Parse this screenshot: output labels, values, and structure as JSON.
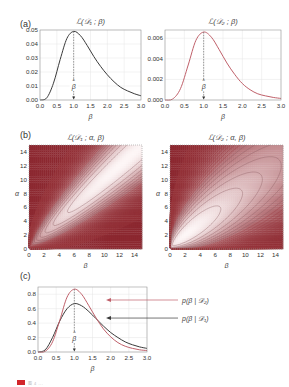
{
  "figure": {
    "panels": {
      "a": {
        "label": "(a)"
      },
      "b": {
        "label": "(b)"
      },
      "c": {
        "label": "(c)"
      }
    },
    "caption": "图 4 ..."
  },
  "colors": {
    "dark_curve": "#3a3a3a",
    "red_curve": "#c0606a",
    "contour_dark": "#8a2a30",
    "contour_light": "#fbeeee",
    "grid": "#e4e4e4",
    "frame": "#999999",
    "caption_mark": "#d2262a"
  },
  "chart_data": [
    {
      "id": "a-left",
      "type": "line",
      "title": "ℒ(𝒟₁ ; β)",
      "xlabel": "β",
      "ylabel": "",
      "xlim": [
        0,
        3.0
      ],
      "ylim": [
        0,
        0.05
      ],
      "xticks": [
        "0.0",
        "0.5",
        "1.0",
        "1.5",
        "2.0",
        "2.5",
        "3.0"
      ],
      "yticks": [
        "0.00",
        "0.01",
        "0.02",
        "0.03",
        "0.04",
        "0.05"
      ],
      "grid": true,
      "annotation": {
        "text": "β̂",
        "x": 1.0,
        "style": "dashed vertical arrow to peak"
      },
      "series": [
        {
          "name": "L(D1;β)",
          "color": "#3a3a3a",
          "x": [
            0.0,
            0.2,
            0.4,
            0.6,
            0.8,
            1.0,
            1.2,
            1.4,
            1.6,
            1.8,
            2.0,
            2.2,
            2.4,
            2.6,
            2.8,
            3.0
          ],
          "y": [
            0.0,
            0.0015,
            0.012,
            0.029,
            0.044,
            0.049,
            0.046,
            0.039,
            0.031,
            0.024,
            0.018,
            0.013,
            0.009,
            0.0065,
            0.0045,
            0.003
          ]
        }
      ]
    },
    {
      "id": "a-right",
      "type": "line",
      "title": "ℒ(𝒟₂ ; β)",
      "xlabel": "β",
      "ylabel": "",
      "xlim": [
        0,
        3.0
      ],
      "ylim": [
        0,
        0.0068
      ],
      "xticks": [
        "0.0",
        "0.5",
        "1.0",
        "1.5",
        "2.0",
        "2.5",
        "3.0"
      ],
      "yticks": [
        "0.000",
        "0.002",
        "0.004",
        "0.006"
      ],
      "grid": true,
      "annotation": {
        "text": "β̂",
        "x": 1.0,
        "style": "dashed vertical arrow to peak"
      },
      "series": [
        {
          "name": "L(D2;β)",
          "color": "#c0606a",
          "x": [
            0.0,
            0.2,
            0.4,
            0.6,
            0.8,
            1.0,
            1.2,
            1.4,
            1.6,
            1.8,
            2.0,
            2.2,
            2.4,
            2.6,
            2.8,
            3.0
          ],
          "y": [
            0.0,
            0.0001,
            0.0011,
            0.0034,
            0.0058,
            0.0066,
            0.0061,
            0.0049,
            0.0036,
            0.0025,
            0.0016,
            0.001,
            0.0006,
            0.0004,
            0.00025,
            0.00015
          ]
        }
      ]
    },
    {
      "id": "b-left",
      "type": "heatmap",
      "title": "ℒ(𝒟₁ ; α, β)",
      "xlabel": "β",
      "ylabel": "α",
      "xlim": [
        0,
        15
      ],
      "ylim": [
        0,
        15
      ],
      "xticks": [
        "0",
        "2",
        "4",
        "6",
        "8",
        "10",
        "12",
        "14"
      ],
      "yticks": [
        "0",
        "2",
        "4",
        "6",
        "8",
        "10",
        "12",
        "14"
      ],
      "style": "contour plot, white ridge along α≈β diagonal, dark red toward edges",
      "ridge": "narrow elongated ellipses along line α ≈ 0.9β"
    },
    {
      "id": "b-right",
      "type": "heatmap",
      "title": "ℒ(𝒟₂ ; α, β)",
      "xlabel": "β",
      "ylabel": "α",
      "xlim": [
        0,
        15
      ],
      "ylim": [
        0,
        15
      ],
      "xticks": [
        "0",
        "2",
        "4",
        "6",
        "8",
        "10",
        "12",
        "14"
      ],
      "yticks": [
        "0",
        "2",
        "4",
        "6",
        "8",
        "10",
        "12",
        "14"
      ],
      "style": "contour plot, broad nested ellipses centered near (β≈3, α≈3)",
      "ridge": "wider contours than D1"
    },
    {
      "id": "c",
      "type": "line",
      "title": "",
      "xlabel": "β",
      "ylabel": "",
      "xlim": [
        0,
        3.0
      ],
      "ylim": [
        0,
        0.9
      ],
      "xticks": [
        "0.0",
        "0.5",
        "1.0",
        "1.5",
        "2.0",
        "2.5",
        "3.0"
      ],
      "yticks": [
        "0.0",
        "0.2",
        "0.4",
        "0.6",
        "0.8"
      ],
      "grid": true,
      "annotation": {
        "text": "β̂",
        "x": 1.0
      },
      "legend": [
        {
          "label": "p(β | 𝒟₂)",
          "color": "#c0606a"
        },
        {
          "label": "p(β | 𝒟₁)",
          "color": "#3a3a3a"
        }
      ],
      "series": [
        {
          "name": "p(β|D1)",
          "color": "#3a3a3a",
          "x": [
            0.0,
            0.2,
            0.4,
            0.6,
            0.8,
            1.0,
            1.2,
            1.4,
            1.6,
            1.8,
            2.0,
            2.2,
            2.4,
            2.6,
            2.8,
            3.0
          ],
          "y": [
            0.0,
            0.03,
            0.2,
            0.43,
            0.6,
            0.67,
            0.64,
            0.56,
            0.46,
            0.36,
            0.27,
            0.2,
            0.14,
            0.1,
            0.07,
            0.05
          ]
        },
        {
          "name": "p(β|D2)",
          "color": "#c0606a",
          "x": [
            0.0,
            0.2,
            0.4,
            0.6,
            0.8,
            1.0,
            1.2,
            1.4,
            1.6,
            1.8,
            2.0,
            2.2,
            2.4,
            2.6,
            2.8,
            3.0
          ],
          "y": [
            0.0,
            0.01,
            0.14,
            0.44,
            0.76,
            0.87,
            0.8,
            0.64,
            0.47,
            0.32,
            0.21,
            0.13,
            0.08,
            0.05,
            0.03,
            0.02
          ]
        }
      ]
    }
  ]
}
